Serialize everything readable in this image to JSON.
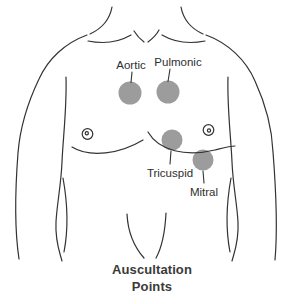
{
  "diagram": {
    "caption": {
      "line1": "Auscultation",
      "line2": "Points"
    },
    "points": [
      {
        "id": "aortic",
        "label": "Aortic"
      },
      {
        "id": "pulmonic",
        "label": "Pulmonic"
      },
      {
        "id": "tricuspid",
        "label": "Tricuspid"
      },
      {
        "id": "mitral",
        "label": "Mitral"
      }
    ],
    "colors": {
      "point": "#9c9c9c",
      "outline": "#333333",
      "label": "#2e2e2e",
      "caption": "#3a3a3a",
      "background": "#ffffff"
    }
  }
}
